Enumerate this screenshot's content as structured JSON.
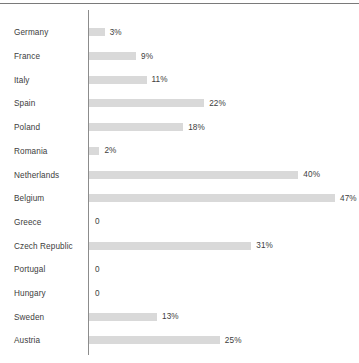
{
  "chart_data": {
    "type": "bar",
    "orientation": "horizontal",
    "title": "",
    "subtitle": "",
    "xlabel": "",
    "ylabel": "",
    "grid": false,
    "legend": null,
    "axis_line": true,
    "xlim": [
      0,
      47
    ],
    "value_suffix": "%",
    "categories": [
      "Germany",
      "France",
      "Italy",
      "Spain",
      "Poland",
      "Romania",
      "Netherlands",
      "Belgium",
      "Greece",
      "Czech Republic",
      "Portugal",
      "Hungary",
      "Sweden",
      "Austria"
    ],
    "values": [
      3,
      9,
      11,
      22,
      18,
      2,
      40,
      47,
      0,
      31,
      0,
      0,
      13,
      25
    ],
    "value_labels": [
      "3%",
      "9%",
      "11%",
      "22%",
      "18%",
      "2%",
      "40%",
      "47%",
      "0",
      "31%",
      "0",
      "0",
      "13%",
      "25%"
    ],
    "colors": {
      "bar": "#d9d9d9",
      "text": "#3d3d3d",
      "axis": "#8c8c8c",
      "border": "#7a7a7a",
      "background": "#ffffff"
    }
  }
}
